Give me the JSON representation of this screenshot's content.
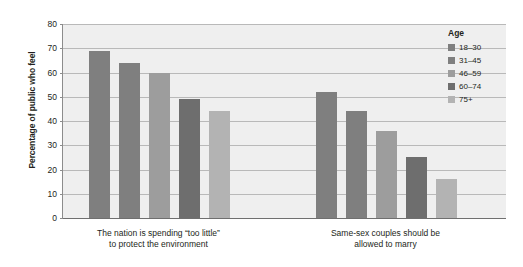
{
  "chart_data": {
    "type": "bar",
    "title": "",
    "subtitle": "",
    "xlabel": "",
    "ylabel": "Percentage of public who feel",
    "ylim": [
      0,
      80
    ],
    "ytick_step": 10,
    "yticks": [
      "80",
      "70",
      "60",
      "50",
      "40",
      "30",
      "20",
      "10",
      "0"
    ],
    "grid": "horizontal",
    "legend_position": "top-right-inside",
    "legend_title": "Age",
    "categories": [
      "The nation is spending “too little” to protect the environment",
      "Same-sex couples should be allowed to marry"
    ],
    "category_lines": [
      [
        "The nation is spending “too little”",
        "to protect the environment"
      ],
      [
        "Same-sex couples should be",
        "allowed to marry"
      ]
    ],
    "series": [
      {
        "name": "18–30",
        "color": "#7f7f7f",
        "values": [
          69,
          52
        ]
      },
      {
        "name": "31–45",
        "color": "#7f7f7f",
        "values": [
          64,
          44
        ]
      },
      {
        "name": "46–59",
        "color": "#9d9d9d",
        "values": [
          60,
          36
        ]
      },
      {
        "name": "60–74",
        "color": "#6e6e6e",
        "values": [
          49,
          25
        ]
      },
      {
        "name": "75+",
        "color": "#b3b3b3",
        "values": [
          44,
          16
        ]
      }
    ],
    "plot_background": "#efefef",
    "gridline_color": "#b9b9b9",
    "axis_color": "#6f6f6f"
  }
}
